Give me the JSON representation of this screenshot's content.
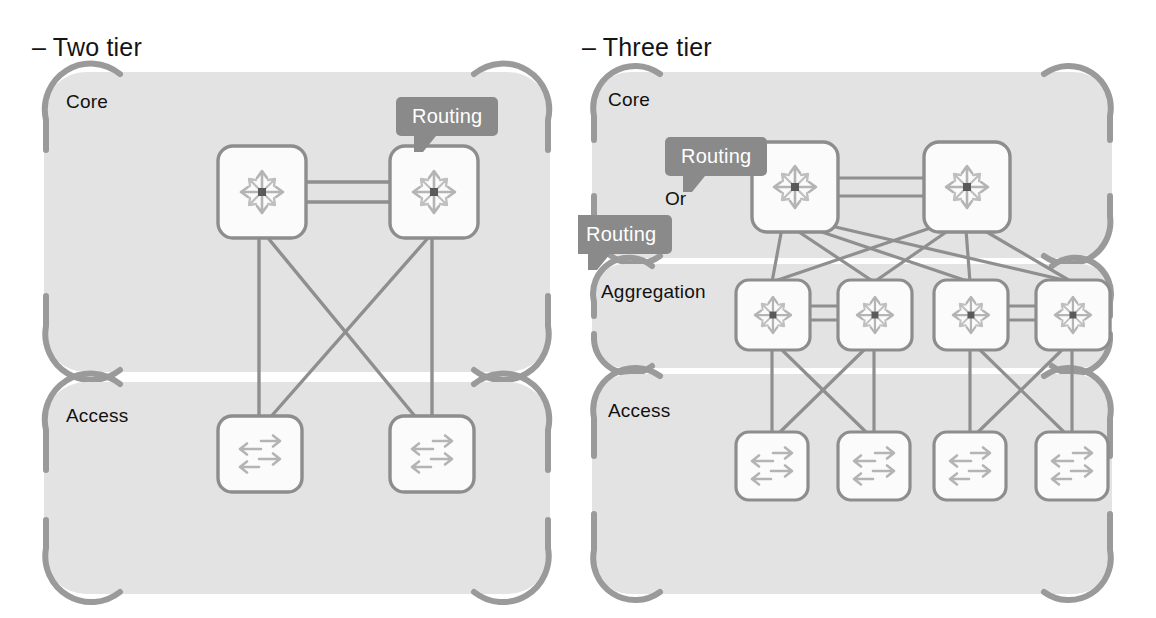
{
  "figure": {
    "background": "#ffffff",
    "panel_fill": "#e3e3e3",
    "panel_border": "#9a9a9a",
    "link_color": "#8f8f8f",
    "node_fill": "#fbfbfb",
    "node_border": "#8d8d8d",
    "icon_color": "#b4b4b4",
    "icon_center": "#5a5a5a",
    "callout_color": "#8a8a8a",
    "text_color": "#141414"
  },
  "panels": [
    {
      "id": "two-tier",
      "title": "– Two tier",
      "zones": [
        {
          "id": "core",
          "label": "Core"
        },
        {
          "id": "access",
          "label": "Access"
        }
      ],
      "callouts": [
        {
          "id": "core-routing",
          "label": "Routing"
        }
      ],
      "nodes": {
        "core": [
          {
            "id": "c1",
            "type": "router"
          },
          {
            "id": "c2",
            "type": "router"
          }
        ],
        "access": [
          {
            "id": "a1",
            "type": "switch"
          },
          {
            "id": "a2",
            "type": "switch"
          }
        ]
      },
      "links": [
        {
          "from": "c1",
          "to": "c2",
          "style": "double"
        },
        {
          "from": "c1",
          "to": "a1",
          "style": "single"
        },
        {
          "from": "c1",
          "to": "a2",
          "style": "single"
        },
        {
          "from": "c2",
          "to": "a1",
          "style": "single"
        },
        {
          "from": "c2",
          "to": "a2",
          "style": "single"
        }
      ]
    },
    {
      "id": "three-tier",
      "title": "– Three tier",
      "zones": [
        {
          "id": "core",
          "label": "Core"
        },
        {
          "id": "aggregation",
          "label": "Aggregation"
        },
        {
          "id": "access",
          "label": "Access"
        }
      ],
      "callouts": [
        {
          "id": "core-routing",
          "label": "Routing"
        },
        {
          "id": "agg-routing",
          "label": "Routing"
        }
      ],
      "or_label": "Or",
      "nodes": {
        "core": [
          {
            "id": "c1",
            "type": "router"
          },
          {
            "id": "c2",
            "type": "router"
          }
        ],
        "aggregation": [
          {
            "id": "g1",
            "type": "router"
          },
          {
            "id": "g2",
            "type": "router"
          },
          {
            "id": "g3",
            "type": "router"
          },
          {
            "id": "g4",
            "type": "router"
          }
        ],
        "access": [
          {
            "id": "s1",
            "type": "switch"
          },
          {
            "id": "s2",
            "type": "switch"
          },
          {
            "id": "s3",
            "type": "switch"
          },
          {
            "id": "s4",
            "type": "switch"
          }
        ]
      },
      "links": [
        {
          "from": "c1",
          "to": "c2",
          "style": "double"
        },
        {
          "from": "g1",
          "to": "g2",
          "style": "double"
        },
        {
          "from": "g3",
          "to": "g4",
          "style": "double"
        },
        {
          "from": "c1",
          "to": "g1",
          "style": "single"
        },
        {
          "from": "c1",
          "to": "g2",
          "style": "single"
        },
        {
          "from": "c1",
          "to": "g3",
          "style": "single"
        },
        {
          "from": "c1",
          "to": "g4",
          "style": "single"
        },
        {
          "from": "c2",
          "to": "g1",
          "style": "single"
        },
        {
          "from": "c2",
          "to": "g2",
          "style": "single"
        },
        {
          "from": "c2",
          "to": "g3",
          "style": "single"
        },
        {
          "from": "c2",
          "to": "g4",
          "style": "single"
        },
        {
          "from": "g1",
          "to": "s1",
          "style": "single"
        },
        {
          "from": "g1",
          "to": "s2",
          "style": "single"
        },
        {
          "from": "g2",
          "to": "s1",
          "style": "single"
        },
        {
          "from": "g2",
          "to": "s2",
          "style": "single"
        },
        {
          "from": "g3",
          "to": "s3",
          "style": "single"
        },
        {
          "from": "g3",
          "to": "s4",
          "style": "single"
        },
        {
          "from": "g4",
          "to": "s3",
          "style": "single"
        },
        {
          "from": "g4",
          "to": "s4",
          "style": "single"
        }
      ]
    }
  ],
  "icons": {
    "router": "router-multidirectional-icon",
    "switch": "switch-bidirectional-icon"
  }
}
